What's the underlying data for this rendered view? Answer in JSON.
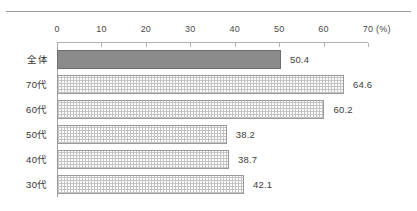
{
  "chart_data": {
    "type": "bar",
    "orientation": "horizontal",
    "title": "",
    "xlabel": "(%)",
    "ylabel": "",
    "xlim": [
      0,
      70
    ],
    "xticks": [
      0,
      10,
      20,
      30,
      40,
      50,
      60,
      70
    ],
    "xtick_labels": [
      "0",
      "10",
      "20",
      "30",
      "40",
      "50",
      "60",
      "70"
    ],
    "unit_label": "(%)",
    "grid": false,
    "legend": false,
    "categories": [
      "全体",
      "70代",
      "60代",
      "50代",
      "40代",
      "30代"
    ],
    "values": [
      50.4,
      64.6,
      60.2,
      38.2,
      38.7,
      42.1
    ],
    "data_labels": [
      "50.4",
      "64.6",
      "60.2",
      "38.2",
      "38.7",
      "42.1"
    ],
    "bar_styles": [
      "solid",
      "hatch",
      "hatch",
      "hatch",
      "hatch",
      "hatch"
    ],
    "colors": {
      "solid_bar_fill": "#8b8b8b",
      "solid_bar_border": "#6f6f6f",
      "hatch_bar_fill": "#fbfbfb",
      "hatch_bar_pattern": "#c4c4c4",
      "hatch_bar_border": "#9a9a9a",
      "axis": "#b0b0b0",
      "text": "#333333",
      "top_rule": "#9a9a9a"
    }
  }
}
